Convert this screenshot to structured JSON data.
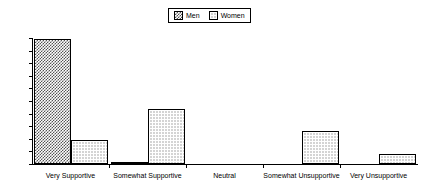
{
  "chart_data": {
    "type": "bar",
    "title": "",
    "subtitle": "",
    "xlabel": "",
    "ylabel": "",
    "ylim": [
      0,
      100
    ],
    "yticks": [
      0,
      10,
      20,
      30,
      40,
      50,
      60,
      70,
      80,
      90,
      100
    ],
    "grid": false,
    "legend_position": "top-center",
    "categories": [
      "Very  Supportive",
      "Somewhat  Supportive",
      "Neutral",
      "Somewhat  Unsupportive",
      "Very  Unsupportive"
    ],
    "series": [
      {
        "name": "Men",
        "pattern": "checkerboard-hatch",
        "values": [
          99,
          1,
          0,
          0,
          0
        ]
      },
      {
        "name": "Women",
        "pattern": "dot-grid",
        "values": [
          19,
          44,
          0,
          26,
          8
        ]
      }
    ]
  },
  "legend": {
    "entries": [
      {
        "label": "Men",
        "swatch": "men-pattern-swatch"
      },
      {
        "label": "Women",
        "swatch": "women-pattern-swatch"
      }
    ]
  },
  "colors": {
    "axis": "#000000",
    "pattern_ink": "#555555",
    "background": "#ffffff"
  }
}
